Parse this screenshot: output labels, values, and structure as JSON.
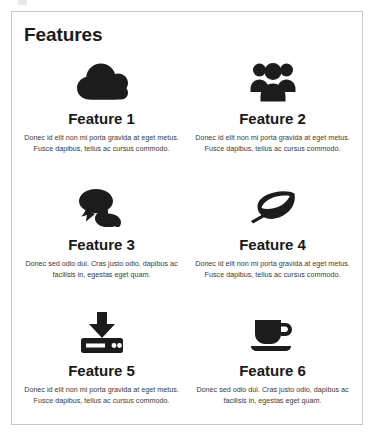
{
  "card": {
    "title": "Features"
  },
  "features": [
    {
      "icon": "cloud-icon",
      "title": "Feature 1",
      "description": "Donec id elit non mi porta gravida at eget metus. Fusce dapibus, tellus ac cursus commodo."
    },
    {
      "icon": "users-group-icon",
      "title": "Feature 2",
      "description": "Donec id elit non mi porta gravida at eget metus. Fusce dapibus, tellus ac cursus commodo."
    },
    {
      "icon": "comments-icon",
      "title": "Feature 3",
      "description": "Donec sed odio dui. Cras justo odio, dapibus ac facilisis in, egestas eget quam."
    },
    {
      "icon": "leaf-icon",
      "title": "Feature 4",
      "description": "Donec id elit non mi porta gravida at eget metus. Fusce dapibus, tellus ac cursus commodo."
    },
    {
      "icon": "download-inbox-icon",
      "title": "Feature 5",
      "description": "Donec id elit non mi porta gravida at eget metus. Fusce dapibus, tellus ac cursus commodo."
    },
    {
      "icon": "coffee-cup-icon",
      "title": "Feature 6",
      "description": "Donec sed odio dui. Cras justo odio, dapibus ac facilisis in, egestas eget quam."
    }
  ],
  "colors": {
    "icon": "#1c1c1c",
    "card_border": "#c8c8c8",
    "title_text": "#181818",
    "body_text": "#3a3a3a",
    "background": "#ffffff"
  }
}
